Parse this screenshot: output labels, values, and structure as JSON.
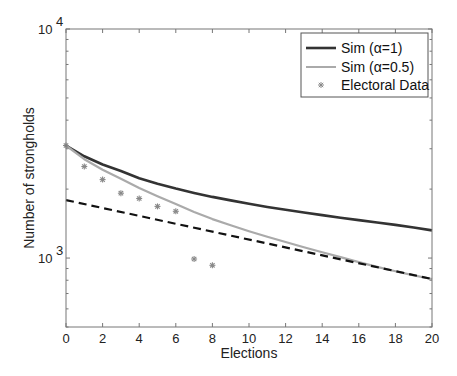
{
  "chart_data": {
    "type": "line",
    "title": "",
    "xlabel": "Elections",
    "ylabel": "Number of strongholds",
    "xlim": [
      0,
      20
    ],
    "ylim": [
      500,
      10000
    ],
    "yscale": "log",
    "grid": false,
    "legend_position": "upper right",
    "x_ticks": [
      0,
      2,
      4,
      6,
      8,
      10,
      12,
      14,
      16,
      18,
      20
    ],
    "y_ticks": [
      {
        "value": 1000,
        "label_base": "10",
        "label_exp": "3"
      },
      {
        "value": 10000,
        "label_base": "10",
        "label_exp": "4"
      }
    ],
    "series": [
      {
        "name": "Sim (α=1)",
        "style": "solid",
        "color": "#333333",
        "width": 2.6,
        "x": [
          0,
          1,
          2,
          3,
          4,
          5,
          6,
          7,
          8,
          9,
          10,
          11,
          12,
          13,
          14,
          15,
          16,
          17,
          18,
          19,
          20
        ],
        "values": [
          3100,
          2780,
          2560,
          2400,
          2230,
          2110,
          2010,
          1925,
          1850,
          1785,
          1725,
          1670,
          1625,
          1580,
          1540,
          1500,
          1465,
          1430,
          1395,
          1360,
          1320
        ]
      },
      {
        "name": "Sim (α=0.5)",
        "style": "solid",
        "color": "#aaaaaa",
        "width": 2.2,
        "x": [
          0,
          1,
          2,
          3,
          4,
          5,
          6,
          7,
          8,
          9,
          10,
          11,
          12,
          13,
          14,
          15,
          16,
          17,
          18,
          19,
          20
        ],
        "values": [
          3100,
          2700,
          2430,
          2220,
          2020,
          1860,
          1720,
          1590,
          1480,
          1390,
          1310,
          1240,
          1175,
          1115,
          1060,
          1010,
          960,
          915,
          875,
          840,
          810
        ]
      },
      {
        "name": "",
        "style": "dashed",
        "color": "#111111",
        "width": 2.2,
        "x": [
          0,
          20
        ],
        "values": [
          1790,
          810
        ]
      }
    ],
    "scatter": {
      "name": "Electoral Data",
      "marker": "asterisk",
      "color": "#888888",
      "x": [
        0,
        1,
        2,
        3,
        4,
        5,
        6,
        7,
        8
      ],
      "values": [
        3100,
        2510,
        2200,
        1920,
        1820,
        1680,
        1600,
        990,
        930
      ]
    },
    "legend": [
      {
        "label": "Sim (α=1)",
        "kind": "line",
        "color": "#333333"
      },
      {
        "label": "Sim (α=0.5)",
        "kind": "line",
        "color": "#aaaaaa"
      },
      {
        "label": "Electoral Data",
        "kind": "marker",
        "color": "#888888"
      }
    ]
  }
}
